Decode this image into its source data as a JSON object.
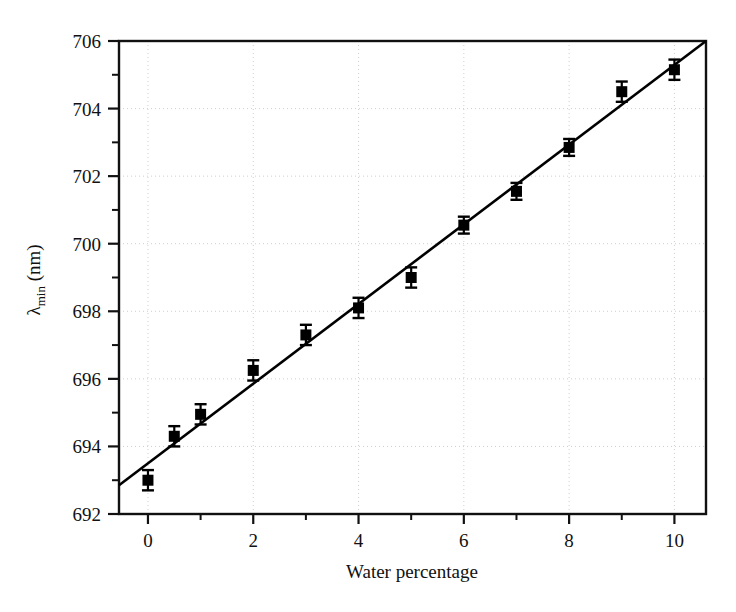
{
  "chart_data": {
    "type": "scatter",
    "title": "",
    "xlabel": "Water percentage",
    "ylabel": "λmin (nm)",
    "ylabel_base": "λ",
    "ylabel_sub": "min",
    "ylabel_unit": " (nm)",
    "xlim": [
      -0.55,
      10.6
    ],
    "ylim": [
      692,
      706
    ],
    "xticks": [
      0,
      2,
      4,
      6,
      8,
      10
    ],
    "xtick_labels": [
      "0",
      "2",
      "4",
      "6",
      "8",
      "10"
    ],
    "xminor_ticks": [
      1,
      3,
      5,
      7,
      9
    ],
    "yticks": [
      692,
      694,
      696,
      698,
      700,
      702,
      704,
      706
    ],
    "ytick_labels": [
      "692",
      "694",
      "696",
      "698",
      "700",
      "702",
      "704",
      "706"
    ],
    "yminor_ticks": [
      693,
      695,
      697,
      699,
      701,
      703,
      705
    ],
    "grid": "dotted-faint",
    "legend": "none",
    "marker": "filled-square",
    "marker_color": "#000000",
    "line_color": "#000000",
    "errorbar_color": "#000000",
    "x": [
      0,
      0.5,
      1,
      2,
      3,
      4,
      5,
      6,
      7,
      8,
      9,
      10
    ],
    "y": [
      693.0,
      694.3,
      694.95,
      696.25,
      697.3,
      698.1,
      699.0,
      700.55,
      701.55,
      702.85,
      704.5,
      705.15
    ],
    "yerr": [
      0.3,
      0.3,
      0.3,
      0.3,
      0.3,
      0.3,
      0.3,
      0.25,
      0.25,
      0.25,
      0.3,
      0.3
    ],
    "fit_line": {
      "x_start": -0.55,
      "y_start": 692.85,
      "x_end": 10.6,
      "y_end": 706.0
    },
    "series": [
      {
        "name": "lambda_min vs water percentage",
        "points": [
          {
            "x": 0,
            "y": 693.0,
            "yerr": 0.3
          },
          {
            "x": 0.5,
            "y": 694.3,
            "yerr": 0.3
          },
          {
            "x": 1,
            "y": 694.95,
            "yerr": 0.3
          },
          {
            "x": 2,
            "y": 696.25,
            "yerr": 0.3
          },
          {
            "x": 3,
            "y": 697.3,
            "yerr": 0.3
          },
          {
            "x": 4,
            "y": 698.1,
            "yerr": 0.3
          },
          {
            "x": 5,
            "y": 699.0,
            "yerr": 0.3
          },
          {
            "x": 6,
            "y": 700.55,
            "yerr": 0.25
          },
          {
            "x": 7,
            "y": 701.55,
            "yerr": 0.25
          },
          {
            "x": 8,
            "y": 702.85,
            "yerr": 0.25
          },
          {
            "x": 9,
            "y": 704.5,
            "yerr": 0.3
          },
          {
            "x": 10,
            "y": 705.15,
            "yerr": 0.3
          }
        ]
      }
    ]
  }
}
